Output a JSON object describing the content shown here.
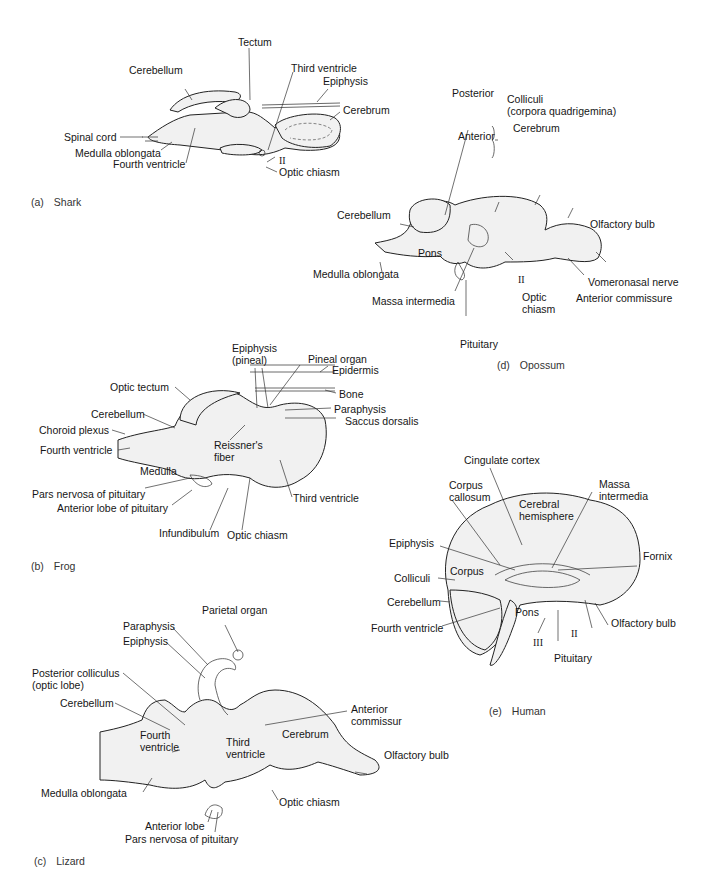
{
  "figure": {
    "panels": [
      {
        "id": "a",
        "caption_letter": "(a)",
        "caption_name": "Shark",
        "labels": [
          "Tectum",
          "Cerebellum",
          "Third ventricle",
          "Epiphysis",
          "Cerebrum",
          "Spinal cord",
          "Medulla oblongata",
          "Fourth ventricle",
          "II",
          "Optic chiasm"
        ]
      },
      {
        "id": "d",
        "caption_letter": "(d)",
        "caption_name": "Opossum",
        "labels": [
          "Posterior",
          "Colliculi",
          "(corpora quadrigemina)",
          "Anterior",
          "Cerebrum",
          "Cerebellum",
          "Olfactory bulb",
          "Pons",
          "Medulla oblongata",
          "II",
          "Vomeronasal nerve",
          "Anterior commissure",
          "Massa intermedia",
          "Optic",
          "chiasm",
          "Pituitary"
        ]
      },
      {
        "id": "b",
        "caption_letter": "(b)",
        "caption_name": "Frog",
        "labels": [
          "Epiphysis",
          "(pineal)",
          "Pineal organ",
          "Epidermis",
          "Optic tectum",
          "Bone",
          "Cerebellum",
          "Paraphysis",
          "Choroid plexus",
          "Saccus dorsalis",
          "Reissner's",
          "fiber",
          "Fourth ventricle",
          "Medulla",
          "Pars nervosa of pituitary",
          "Third ventricle",
          "Anterior lobe of pituitary",
          "Infundibulum",
          "Optic chiasm"
        ]
      },
      {
        "id": "e",
        "caption_letter": "(e)",
        "caption_name": "Human",
        "labels": [
          "Cingulate cortex",
          "Corpus",
          "callosum",
          "Massa",
          "intermedia",
          "Cerebral",
          "hemisphere",
          "Epiphysis",
          "Fornix",
          "Corpus",
          "Colliculi",
          "Cerebellum",
          "Pons",
          "Olfactory bulb",
          "Fourth ventricle",
          "II",
          "III",
          "Pituitary"
        ]
      },
      {
        "id": "c",
        "caption_letter": "(c)",
        "caption_name": "Lizard",
        "labels": [
          "Parietal organ",
          "Paraphysis",
          "Epiphysis",
          "Posterior colliculus",
          "(optic lobe)",
          "Cerebellum",
          "Anterior",
          "commissur",
          "Fourth",
          "ventricle",
          "Third",
          "ventricle",
          "Cerebrum",
          "Olfactory bulb",
          "Medulla oblongata",
          "Optic chiasm",
          "Anterior lobe",
          "Pars nervosa of pituitary"
        ]
      }
    ]
  },
  "text": {
    "a": {
      "tectum": "Tectum",
      "cerebellum": "Cerebellum",
      "third_ventricle": "Third ventricle",
      "epiphysis": "Epiphysis",
      "cerebrum": "Cerebrum",
      "spinal_cord": "Spinal cord",
      "medulla": "Medulla oblongata",
      "fourth_ventricle": "Fourth ventricle",
      "ii": "II",
      "optic_chiasm": "Optic chiasm",
      "cap_letter": "(a)",
      "cap_name": "Shark"
    },
    "d": {
      "posterior": "Posterior",
      "colliculi": "Colliculi",
      "corpora": "(corpora quadrigemina)",
      "anterior": "Anterior",
      "cerebrum": "Cerebrum",
      "cerebellum": "Cerebellum",
      "olfactory_bulb": "Olfactory bulb",
      "pons": "Pons",
      "medulla": "Medulla oblongata",
      "ii": "II",
      "vomeronasal": "Vomeronasal nerve",
      "anterior_commissure": "Anterior commissure",
      "massa": "Massa intermedia",
      "optic": "Optic",
      "chiasm": "chiasm",
      "pituitary": "Pituitary",
      "cap_letter": "(d)",
      "cap_name": "Opossum"
    },
    "b": {
      "epiphysis": "Epiphysis",
      "pineal": "(pineal)",
      "pineal_organ": "Pineal organ",
      "epidermis": "Epidermis",
      "optic_tectum": "Optic tectum",
      "bone": "Bone",
      "cerebellum": "Cerebellum",
      "paraphysis": "Paraphysis",
      "choroid": "Choroid plexus",
      "saccus": "Saccus dorsalis",
      "reissners": "Reissner's",
      "fiber": "fiber",
      "fourth_ventricle": "Fourth ventricle",
      "medulla": "Medulla",
      "pars_nervosa": "Pars nervosa of pituitary",
      "third_ventricle": "Third ventricle",
      "anterior_lobe": "Anterior lobe of pituitary",
      "infundibulum": "Infundibulum",
      "optic_chiasm": "Optic chiasm",
      "cap_letter": "(b)",
      "cap_name": "Frog"
    },
    "e": {
      "cingulate": "Cingulate cortex",
      "corpus": "Corpus",
      "callosum": "callosum",
      "massa": "Massa",
      "intermedia": "intermedia",
      "cerebral": "Cerebral",
      "hemisphere": "hemisphere",
      "epiphysis": "Epiphysis",
      "fornix": "Fornix",
      "colliculi": "Colliculi",
      "cerebellum": "Cerebellum",
      "pons": "Pons",
      "olfactory_bulb": "Olfactory bulb",
      "fourth_ventricle": "Fourth ventricle",
      "ii": "II",
      "iii": "III",
      "pituitary": "Pituitary",
      "cap_letter": "(e)",
      "cap_name": "Human"
    },
    "c": {
      "parietal": "Parietal organ",
      "paraphysis": "Paraphysis",
      "epiphysis": "Epiphysis",
      "post_colliculus": "Posterior colliculus",
      "optic_lobe": "(optic lobe)",
      "cerebellum": "Cerebellum",
      "anterior": "Anterior",
      "commissur": "commissur",
      "fourth": "Fourth",
      "ventricle4": "ventricle",
      "third": "Third",
      "ventricle3": "ventricle",
      "cerebrum": "Cerebrum",
      "olfactory_bulb": "Olfactory bulb",
      "medulla": "Medulla oblongata",
      "optic_chiasm": "Optic chiasm",
      "anterior_lobe": "Anterior lobe",
      "pars_nervosa": "Pars nervosa of pituitary",
      "cap_letter": "(c)",
      "cap_name": "Lizard"
    }
  }
}
